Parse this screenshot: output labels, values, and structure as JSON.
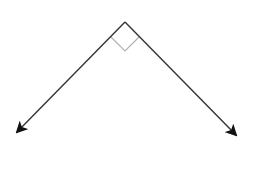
{
  "diagram": {
    "type": "right-angle-rays",
    "background": "#ffffff",
    "stroke_color": "#333333",
    "marker_color": "#b0b0b0",
    "vertex": {
      "x": 125,
      "y": 22
    },
    "rays": [
      {
        "name": "left-ray",
        "end": {
          "x": 17,
          "y": 132
        }
      },
      {
        "name": "right-ray",
        "end": {
          "x": 236,
          "y": 135
        }
      }
    ],
    "right_angle_marker": {
      "points": [
        [
          111,
          37
        ],
        [
          125,
          51
        ],
        [
          139,
          37
        ]
      ]
    }
  }
}
